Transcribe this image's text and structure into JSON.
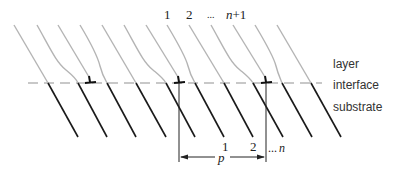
{
  "diagram": {
    "top_labels": {
      "first": "1",
      "second": "2",
      "ellipsis": "...",
      "last_var": "n",
      "last_suffix": "+1"
    },
    "region_labels": {
      "layer": "layer",
      "interface": "interface",
      "substrate": "substrate"
    },
    "bottom_labels": {
      "first": "1",
      "second": "2",
      "ellipsis": "...",
      "last_var": "n",
      "period": "p"
    },
    "colors": {
      "layer_planes": "#b4b4b4",
      "substrate_planes": "#1a1a1a",
      "interface": "#c8c8c8",
      "dislocation": "#111111"
    },
    "layer_plane_count": 13,
    "substrate_plane_count": 10,
    "dislocation_count": 3
  }
}
